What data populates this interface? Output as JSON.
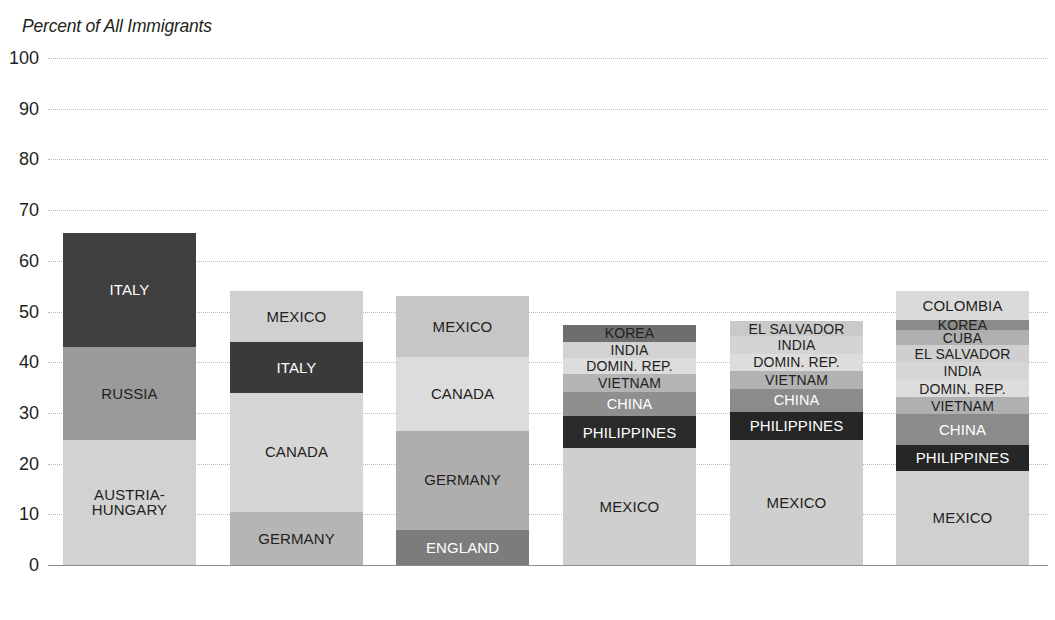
{
  "chart_data": {
    "type": "bar",
    "title": "Percent of All Immigrants",
    "xlabel": "",
    "ylabel": "Percent of All Immigrants",
    "ylim": [
      0,
      100
    ],
    "yticks": [
      0,
      10,
      20,
      30,
      40,
      50,
      60,
      70,
      80,
      90,
      100
    ],
    "ytick_labels": [
      "0",
      "10",
      "20",
      "30",
      "40",
      "50",
      "60",
      "70",
      "80",
      "90",
      "100"
    ],
    "grid": true,
    "legend": "none",
    "stacked": true,
    "note": "Stacked bar chart of the leading countries of birth as a percent of all immigrants, by decade. Each segment is labeled in place; segments are ordered bottom to top.",
    "categories": [
      "1901-1910",
      "1921-1930",
      "1951-1960",
      "1981-1990",
      "1991-2000",
      "2001-2010"
    ],
    "bars": [
      {
        "category": "1901-1910",
        "total": 65.5,
        "segments": [
          {
            "label": "AUSTRIA-\nHUNGARY",
            "value": 24.7,
            "color": "#d2d2d2",
            "text_color": "#231f20"
          },
          {
            "label": "RUSSIA",
            "value": 18.3,
            "color": "#9a9a9a",
            "text_color": "#231f20"
          },
          {
            "label": "ITALY",
            "value": 22.5,
            "color": "#404040",
            "text_color": "#ffffff"
          }
        ]
      },
      {
        "category": "1921-1930",
        "total": 54.0,
        "segments": [
          {
            "label": "GERMANY",
            "value": 10.5,
            "color": "#b5b5b5",
            "text_color": "#231f20"
          },
          {
            "label": "CANADA",
            "value": 23.5,
            "color": "#d6d6d6",
            "text_color": "#231f20"
          },
          {
            "label": "ITALY",
            "value": 10.0,
            "color": "#3a3a3a",
            "text_color": "#ffffff"
          },
          {
            "label": "MEXICO",
            "value": 10.0,
            "color": "#d0d0d0",
            "text_color": "#231f20"
          }
        ]
      },
      {
        "category": "1951-1960",
        "total": 53.0,
        "segments": [
          {
            "label": "ENGLAND",
            "value": 7.0,
            "color": "#7c7c7c",
            "text_color": "#ffffff"
          },
          {
            "label": "GERMANY",
            "value": 19.5,
            "color": "#aeaeae",
            "text_color": "#231f20"
          },
          {
            "label": "CANADA",
            "value": 14.5,
            "color": "#dcdcdc",
            "text_color": "#231f20"
          },
          {
            "label": "MEXICO",
            "value": 12.0,
            "color": "#c6c6c6",
            "text_color": "#231f20"
          }
        ]
      },
      {
        "category": "1981-1990",
        "total": 50.5,
        "segments": [
          {
            "label": "MEXICO",
            "value": 23.0,
            "color": "#cfcfcf",
            "text_color": "#231f20"
          },
          {
            "label": "PHILIPPINES",
            "value": 6.3,
            "color": "#2b2b2b",
            "text_color": "#ffffff"
          },
          {
            "label": "CHINA",
            "value": 4.9,
            "color": "#8f8f8f",
            "text_color": "#ffffff"
          },
          {
            "label": "VIETNAM",
            "value": 3.4,
            "color": "#b4b4b4",
            "text_color": "#231f20"
          },
          {
            "label": "DOMIN. REP.",
            "value": 3.2,
            "color": "#dcdcdc",
            "text_color": "#231f20"
          },
          {
            "label": "INDIA",
            "value": 3.2,
            "color": "#d2d2d2",
            "text_color": "#231f20"
          },
          {
            "label": "KOREA",
            "value": 3.4,
            "color": "#6e6e6e",
            "text_color": "#231f20"
          }
        ]
      },
      {
        "category": "1991-2000",
        "total": 52.6,
        "segments": [
          {
            "label": "MEXICO",
            "value": 24.7,
            "color": "#cfcfcf",
            "text_color": "#231f20"
          },
          {
            "label": "PHILIPPINES",
            "value": 5.5,
            "color": "#262626",
            "text_color": "#ffffff"
          },
          {
            "label": "CHINA",
            "value": 4.5,
            "color": "#8b8b8b",
            "text_color": "#ffffff"
          },
          {
            "label": "VIETNAM",
            "value": 3.6,
            "color": "#b2b2b2",
            "text_color": "#231f20"
          },
          {
            "label": "DOMIN. REP.",
            "value": 3.4,
            "color": "#dddddd",
            "text_color": "#231f20"
          },
          {
            "label": "INDIA",
            "value": 3.4,
            "color": "#d4d4d4",
            "text_color": "#231f20"
          },
          {
            "label": "EL SALVADOR",
            "value": 3.0,
            "color": "#c9c9c9",
            "text_color": "#231f20"
          }
        ]
      },
      {
        "category": "2001-2010",
        "total": 54.0,
        "segments": [
          {
            "label": "MEXICO",
            "value": 18.5,
            "color": "#d0d0d0",
            "text_color": "#231f20"
          },
          {
            "label": "PHILIPPINES",
            "value": 5.2,
            "color": "#262626",
            "text_color": "#ffffff"
          },
          {
            "label": "CHINA",
            "value": 6.0,
            "color": "#8b8b8b",
            "text_color": "#ffffff"
          },
          {
            "label": "VIETNAM",
            "value": 3.4,
            "color": "#b0b0b0",
            "text_color": "#231f20"
          },
          {
            "label": "DOMIN. REP.",
            "value": 3.3,
            "color": "#dcdcdc",
            "text_color": "#231f20"
          },
          {
            "label": "INDIA",
            "value": 3.6,
            "color": "#d6d6d6",
            "text_color": "#231f20"
          },
          {
            "label": "EL SALVADOR",
            "value": 3.3,
            "color": "#cfcfcf",
            "text_color": "#231f20"
          },
          {
            "label": "CUBA",
            "value": 3.0,
            "color": "#b0b0b0",
            "text_color": "#231f20"
          },
          {
            "label": "KOREA",
            "value": 2.1,
            "color": "#8c8c8c",
            "text_color": "#231f20"
          },
          {
            "label": "COLOMBIA",
            "value": 5.6,
            "color": "#dadada",
            "text_color": "#231f20"
          }
        ]
      }
    ]
  },
  "layout": {
    "plot_left": 48,
    "plot_top": 58,
    "plot_width": 1000,
    "plot_height": 507,
    "bar_width": 133,
    "bar_x": [
      15,
      182,
      348,
      515,
      682,
      848
    ]
  },
  "colors": {
    "background": "#ffffff",
    "text": "#231f20",
    "gridline": "#b9b9b9",
    "axis": "#8d8d8d"
  }
}
